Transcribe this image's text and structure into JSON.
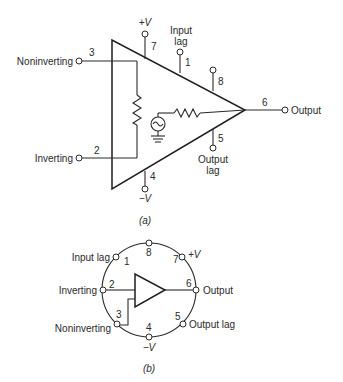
{
  "diagram_a": {
    "caption": "(a)",
    "labels": {
      "noninverting": "Noninverting",
      "inverting": "Inverting",
      "output": "Output",
      "plus_v": "+V",
      "minus_v": "−V",
      "input_lag_1": "Input",
      "input_lag_2": "lag",
      "output_lag_1": "Output",
      "output_lag_2": "lag"
    },
    "pins": {
      "p1": "1",
      "p2": "2",
      "p3": "3",
      "p4": "4",
      "p5": "5",
      "p6": "6",
      "p7": "7",
      "p8": "8"
    },
    "components": [
      "input-resistor",
      "ac-source",
      "ground",
      "output-resistor"
    ]
  },
  "diagram_b": {
    "caption": "(b)",
    "labels": {
      "input_lag": "Input lag",
      "inverting": "Inverting",
      "noninverting": "Noninverting",
      "plus_v": "+V",
      "minus_v": "−V",
      "output": "Output",
      "output_lag": "Output lag"
    },
    "pins": {
      "p1": "1",
      "p2": "2",
      "p3": "3",
      "p4": "4",
      "p5": "5",
      "p6": "6",
      "p7": "7",
      "p8": "8"
    }
  },
  "colors": {
    "ink": "#2a2a2a",
    "background": "#ffffff"
  }
}
